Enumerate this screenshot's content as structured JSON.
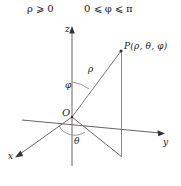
{
  "figure": {
    "title_conditions": {
      "rho_condition": "ρ ⩾ 0",
      "phi_condition": "0 ⩽ φ ⩽ π"
    },
    "axes": [
      {
        "name": "z-axis",
        "label": "z",
        "direction": "up"
      },
      {
        "name": "x-axis",
        "label": "x",
        "direction": "down-left"
      },
      {
        "name": "y-axis",
        "label": "y",
        "direction": "right"
      }
    ],
    "origin_label": "O",
    "point_label": "P(ρ, θ, φ)",
    "segment_labels": {
      "radius": "ρ",
      "polar_angle": "φ",
      "azimuthal_angle": "θ"
    },
    "colors": {
      "stroke": "#555555",
      "text": "#1a1a1a",
      "background": "#ffffff"
    }
  }
}
